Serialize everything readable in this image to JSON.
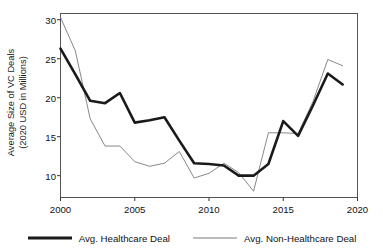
{
  "chart_data": {
    "type": "line",
    "title": "",
    "xlabel": "",
    "ylabel": "Average Size of VC Deals (2020 USD in Millions)",
    "ylabel_line1": "Average Size of VC Deals",
    "ylabel_line2": "(2020 USD in Millions)",
    "xlim": [
      2000,
      2020
    ],
    "ylim": [
      7.2,
      30.8
    ],
    "grid": false,
    "legend_position": "bottom",
    "xticks": [
      2000,
      2005,
      2010,
      2015,
      2020
    ],
    "xtick_labels": [
      "2000",
      "2005",
      "2010",
      "2015",
      "2020"
    ],
    "yticks": [
      10,
      15,
      20,
      25,
      30
    ],
    "ytick_labels": [
      "10",
      "15",
      "20",
      "25",
      "30"
    ],
    "x": [
      2000,
      2001,
      2002,
      2003,
      2004,
      2005,
      2006,
      2007,
      2008,
      2009,
      2010,
      2011,
      2012,
      2013,
      2014,
      2015,
      2016,
      2017,
      2018,
      2019
    ],
    "series": [
      {
        "name": "Avg. Healthcare Deal",
        "color": "#1a1a1a",
        "width": 2.6,
        "values": [
          26.3,
          23.0,
          19.6,
          19.3,
          20.6,
          16.8,
          17.1,
          17.5,
          14.5,
          11.6,
          11.5,
          11.3,
          10.0,
          10.0,
          11.5,
          17.0,
          15.1,
          19.0,
          23.1,
          21.7
        ]
      },
      {
        "name": "Avg. Non-Healthcare Deal",
        "color": "#7a7a7a",
        "width": 0.9,
        "values": [
          30.3,
          26.0,
          17.3,
          13.8,
          13.8,
          11.8,
          11.2,
          11.6,
          13.1,
          9.7,
          10.3,
          11.6,
          10.4,
          8.0,
          15.5,
          15.5,
          15.4,
          19.5,
          24.9,
          24.1
        ]
      }
    ]
  },
  "legend": {
    "items": [
      {
        "label": "Avg. Healthcare Deal"
      },
      {
        "label": "Avg. Non-Healthcare Deal"
      }
    ]
  }
}
